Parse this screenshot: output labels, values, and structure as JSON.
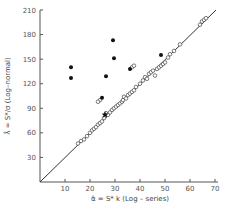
{
  "chart_data": {
    "type": "scatter",
    "title": "",
    "xlabel": "α̂ = S* k  (Log – series)",
    "ylabel": "λ̂ = S*/σ  (Log–normal)",
    "xlim": [
      0,
      70
    ],
    "ylim": [
      0,
      210
    ],
    "x_ticks": [
      10,
      20,
      30,
      40,
      50,
      60,
      70
    ],
    "y_ticks": [
      30,
      60,
      90,
      120,
      150,
      180,
      210
    ],
    "grid": false,
    "legend": null,
    "reference_line": {
      "description": "y = 3x",
      "from": [
        0,
        0
      ],
      "to": [
        70,
        210
      ]
    },
    "series": [
      {
        "name": "open circles",
        "marker": "open-circle",
        "points": [
          [
            15.2,
            47
          ],
          [
            16.4,
            50
          ],
          [
            17.6,
            52
          ],
          [
            18.8,
            56
          ],
          [
            20,
            60
          ],
          [
            20.8,
            63
          ],
          [
            21.6,
            65
          ],
          [
            22.4,
            67
          ],
          [
            23.2,
            70
          ],
          [
            24,
            72
          ],
          [
            24.8,
            74
          ],
          [
            24,
            100
          ],
          [
            23.2,
            98
          ],
          [
            25.6,
            78
          ],
          [
            26.4,
            84
          ],
          [
            27.2,
            82
          ],
          [
            28,
            85
          ],
          [
            28.8,
            88
          ],
          [
            29.6,
            90
          ],
          [
            30.4,
            92
          ],
          [
            31.2,
            94
          ],
          [
            32,
            96
          ],
          [
            32.8,
            98
          ],
          [
            33.2,
            100
          ],
          [
            33.6,
            104
          ],
          [
            34.4,
            102
          ],
          [
            35.2,
            106
          ],
          [
            36,
            108
          ],
          [
            36.8,
            110
          ],
          [
            37.6,
            112
          ],
          [
            38.4,
            116
          ],
          [
            36.8,
            140
          ],
          [
            37.6,
            142
          ],
          [
            40,
            120
          ],
          [
            41.2,
            124
          ],
          [
            42,
            128
          ],
          [
            42.8,
            126
          ],
          [
            43.6,
            132
          ],
          [
            44.4,
            134
          ],
          [
            45.2,
            136
          ],
          [
            46,
            130
          ],
          [
            46.8,
            138
          ],
          [
            47.6,
            140
          ],
          [
            48.4,
            142
          ],
          [
            49.2,
            144
          ],
          [
            50,
            146
          ],
          [
            51.2,
            152
          ],
          [
            52,
            156
          ],
          [
            53.6,
            160
          ],
          [
            56,
            168
          ],
          [
            64,
            192
          ],
          [
            64.8,
            196
          ],
          [
            65.6,
            198
          ],
          [
            66.4,
            200
          ]
        ]
      },
      {
        "name": "filled circles",
        "marker": "filled-circle",
        "points": [
          [
            12.4,
            140
          ],
          [
            12.4,
            127
          ],
          [
            29.2,
            173
          ],
          [
            29.6,
            151
          ],
          [
            26.4,
            129
          ],
          [
            36,
            138
          ],
          [
            24.8,
            103
          ],
          [
            48.4,
            155
          ]
        ]
      },
      {
        "name": "star",
        "marker": "star",
        "points": [
          [
            26,
            82
          ]
        ]
      }
    ]
  }
}
